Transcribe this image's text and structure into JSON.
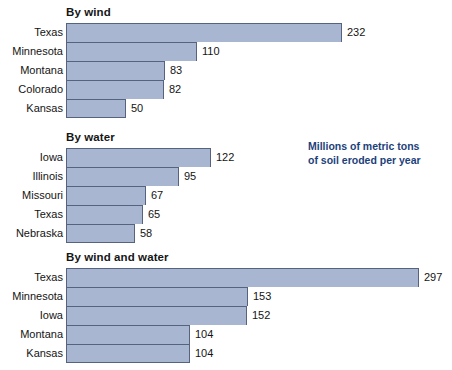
{
  "legend": {
    "line1": "Millions of metric tons",
    "line2": "of soil eroded per year",
    "color": "#1d3f7a"
  },
  "style": {
    "bar_fill": "#a9b6d2",
    "bar_border": "#55637f",
    "background": "#ffffff",
    "text_color": "#141414"
  },
  "chart_data": [
    {
      "type": "bar",
      "title": "By wind",
      "orientation": "horizontal",
      "categories": [
        "Texas",
        "Minnesota",
        "Montana",
        "Colorado",
        "Kansas"
      ],
      "values": [
        232,
        110,
        83,
        82,
        50
      ],
      "value_labels": [
        "232",
        "110",
        "83",
        "82",
        "50"
      ],
      "xlabel": "",
      "ylabel": "",
      "xlim": [
        0,
        297
      ],
      "grid": false,
      "unit": "Millions of metric tons of soil eroded per year"
    },
    {
      "type": "bar",
      "title": "By water",
      "orientation": "horizontal",
      "categories": [
        "Iowa",
        "Illinois",
        "Missouri",
        "Texas",
        "Nebraska"
      ],
      "values": [
        122,
        95,
        67,
        65,
        58
      ],
      "value_labels": [
        "122",
        "95",
        "67",
        "65",
        "58"
      ],
      "xlabel": "",
      "ylabel": "",
      "xlim": [
        0,
        297
      ],
      "grid": false,
      "unit": "Millions of metric tons of soil eroded per year"
    },
    {
      "type": "bar",
      "title": "By wind and water",
      "orientation": "horizontal",
      "categories": [
        "Texas",
        "Minnesota",
        "Iowa",
        "Montana",
        "Kansas"
      ],
      "values": [
        297,
        153,
        152,
        104,
        104
      ],
      "value_labels": [
        "297",
        "153",
        "152",
        "104",
        "104"
      ],
      "xlabel": "",
      "ylabel": "",
      "xlim": [
        0,
        297
      ],
      "grid": false,
      "unit": "Millions of metric tons of soil eroded per year"
    }
  ]
}
